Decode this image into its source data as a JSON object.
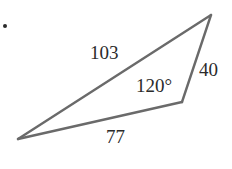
{
  "figure": {
    "type": "triangle-diagram",
    "background_color": "#ffffff",
    "stroke_color": "#6a6a6a",
    "stroke_width": 2.4,
    "text_color": "#2b2b2b",
    "bullet": {
      "name": "bullet-dot",
      "color": "#2b2b2b"
    },
    "vertices": {
      "apex_top_right": {
        "x": 211,
        "y": 15
      },
      "bottom_left": {
        "x": 18,
        "y": 139
      },
      "bottom_right": {
        "x": 182,
        "y": 102
      }
    },
    "sides": [
      {
        "name": "side-103",
        "label": "103",
        "from": "bottom_left",
        "to": "apex_top_right"
      },
      {
        "name": "side-40",
        "label": "40",
        "from": "apex_top_right",
        "to": "bottom_right"
      },
      {
        "name": "side-77",
        "label": "77",
        "from": "bottom_right",
        "to": "bottom_left"
      }
    ],
    "angles": [
      {
        "name": "angle-120",
        "label": "120°",
        "at_vertex": "bottom_right"
      }
    ],
    "labels": {
      "side_103": "103",
      "side_40": "40",
      "side_77": "77",
      "angle_120": "120°"
    }
  }
}
